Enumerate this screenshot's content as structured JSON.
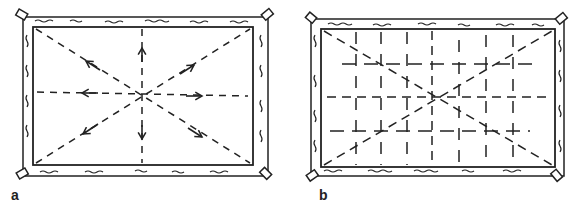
{
  "panels": [
    {
      "id": "a",
      "label": "a",
      "description": "Frame with stretching directions: dashed lines radiating from center with arrows pointing outward toward edges and corners"
    },
    {
      "id": "b",
      "label": "b",
      "description": "Frame with grid of short dashed crosses overlaid on diagonal and center lines"
    }
  ],
  "colors": {
    "ink": "#222222",
    "background": "#ffffff"
  }
}
